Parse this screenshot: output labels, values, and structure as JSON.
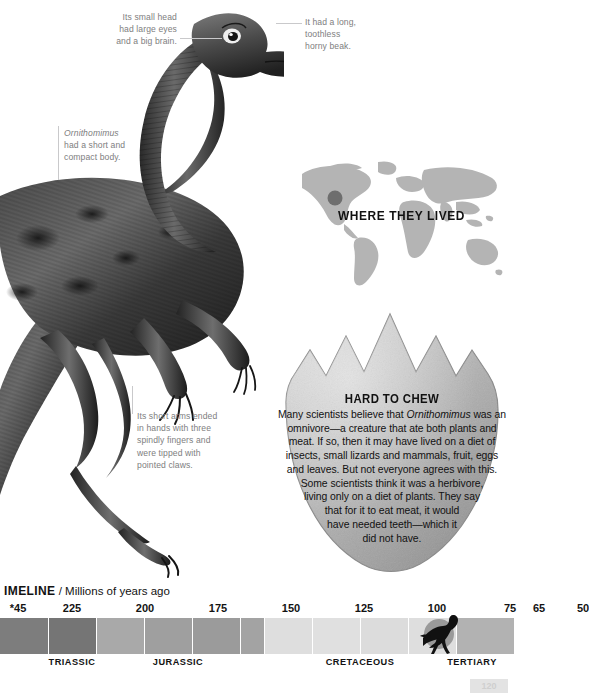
{
  "annotations": {
    "head": "Its small head\nhad large eyes\nand a big brain.",
    "beak": "It had a long,\ntoothless\nhorny beak.",
    "body_species": "Ornithomimus",
    "body_rest": "had a short and\ncompact body.",
    "arms": "Its short arms ended\nin hands with three\nspindly fingers and\nwere tipped with\npointed claws."
  },
  "map": {
    "title": "WHERE THEY LIVED",
    "land_color": "#b4b4b4",
    "marker_color": "#6e6e6e"
  },
  "egg": {
    "title": "HARD TO CHEW",
    "lines": [
      "Many scientists believe that |Ornithomimus| was an",
      "omnivore—a creature that ate both plants and",
      "meat. If so, then it may have lived on a diet of",
      "insects, small lizards and mammals, fruit, eggs",
      "and leaves. But not everyone agrees with this.",
      "Some scientists think it was a herbivore,",
      "living only on a diet of plants. They say",
      "that for it to eat meat, it would",
      "have needed teeth—which it",
      "did not have."
    ],
    "shell_color": "#b6b6b6"
  },
  "timeline": {
    "label_bold": "IMELINE",
    "label_rest": " / Millions of years ago",
    "ticks": [
      {
        "text": "*45",
        "x": 18
      },
      {
        "text": "225",
        "x": 72
      },
      {
        "text": "200",
        "x": 145
      },
      {
        "text": "175",
        "x": 218
      },
      {
        "text": "150",
        "x": 291
      },
      {
        "text": "125",
        "x": 364
      },
      {
        "text": "100",
        "x": 437
      },
      {
        "text": "75",
        "x": 510
      },
      {
        "text": "65",
        "x": 539
      },
      {
        "text": "50",
        "x": 583
      }
    ],
    "segments": [
      {
        "left": 0,
        "width": 48,
        "color": "#7d7d7d"
      },
      {
        "left": 48,
        "width": 48,
        "color": "#757575"
      },
      {
        "left": 96,
        "width": 48,
        "color": "#a9a9a9"
      },
      {
        "left": 144,
        "width": 48,
        "color": "#9f9f9f"
      },
      {
        "left": 192,
        "width": 48,
        "color": "#9b9b9b"
      },
      {
        "left": 240,
        "width": 24,
        "color": "#a3a3a3"
      },
      {
        "left": 264,
        "width": 48,
        "color": "#dedede"
      },
      {
        "left": 312,
        "width": 48,
        "color": "#e0e0e0"
      },
      {
        "left": 360,
        "width": 48,
        "color": "#dcdcdc"
      },
      {
        "left": 408,
        "width": 48,
        "color": "#dedede"
      },
      {
        "left": 456,
        "width": 58,
        "color": "#b2b2b2"
      }
    ],
    "dividers": [
      48,
      96,
      144,
      192,
      240,
      264,
      312,
      360,
      408,
      456
    ],
    "periods": [
      {
        "text": "TRIASSIC",
        "x": 72
      },
      {
        "text": "JURASSIC",
        "x": 178
      },
      {
        "text": "CRETACEOUS",
        "x": 360
      },
      {
        "text": "TERTIARY",
        "x": 472
      }
    ],
    "marker_circle_color": "#9a9a9a",
    "marker_silhouette_color": "#111111"
  },
  "page_number": "120"
}
